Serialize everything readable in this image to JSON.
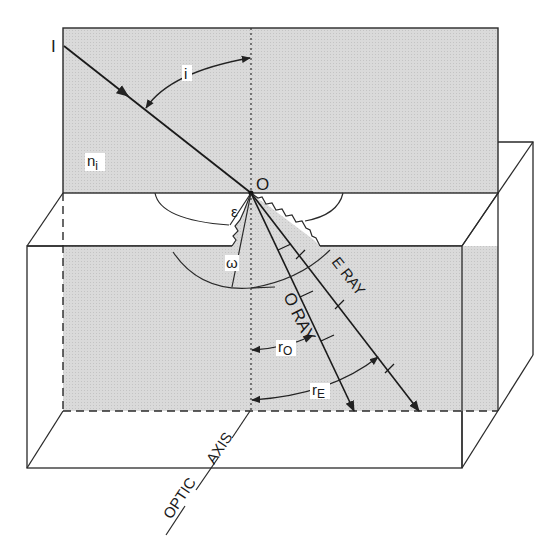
{
  "figure": {
    "colors": {
      "shading": "#d6d6d6",
      "line": "#2a2a2a",
      "background": "#ffffff"
    }
  },
  "labels": {
    "incident_point": "I",
    "incident_angle": "i",
    "incident_medium_index": "n",
    "incident_medium_index_sub": "i",
    "origin": "O",
    "epsilon": "ε",
    "omega": "ω",
    "o_ray": "O RAY",
    "e_ray": "E RAY",
    "r_o": "r",
    "r_o_sub": "O",
    "r_e": "r",
    "r_e_sub": "E",
    "optic_axis_word1": "OPTIC",
    "optic_axis_word2": "AXIS"
  }
}
